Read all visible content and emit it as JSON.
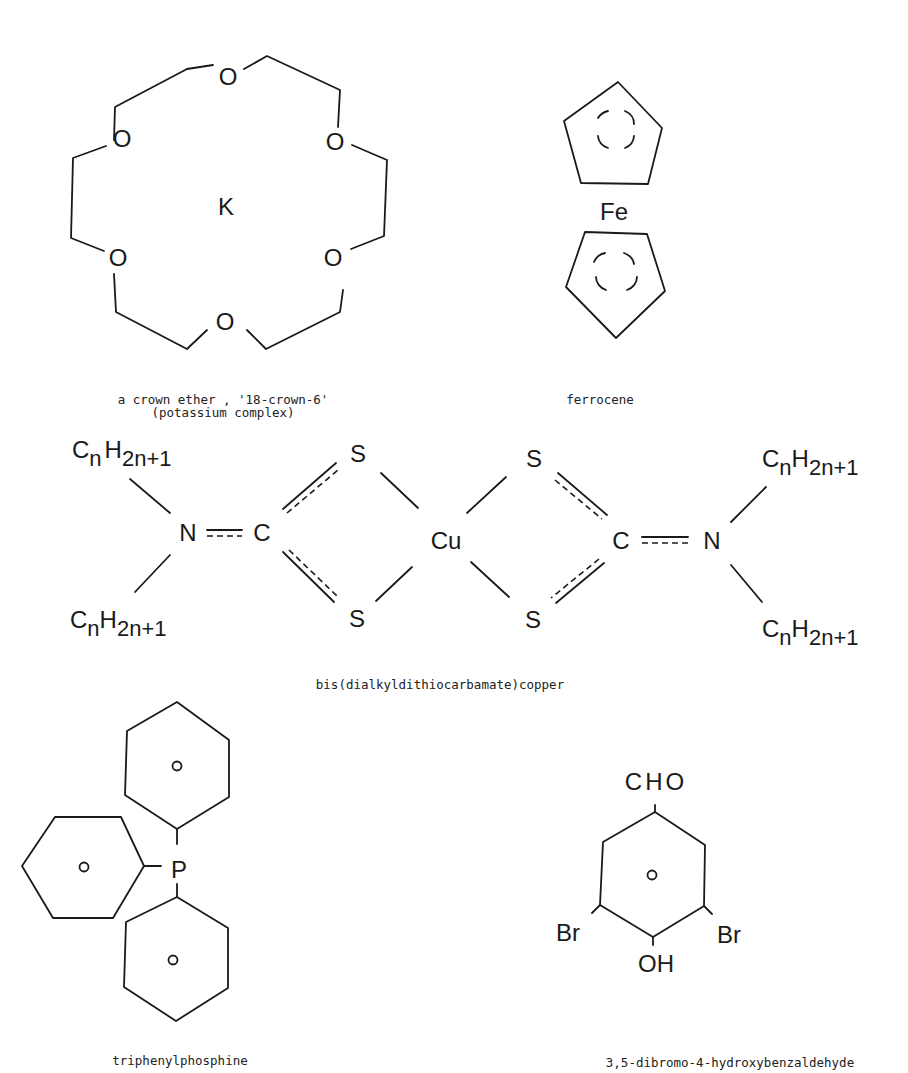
{
  "page": {
    "header_left": "Ionophores",
    "header_right": "419"
  },
  "structures": {
    "crown_ether": {
      "center_atom": "K",
      "ring_atom": "O",
      "caption_line1": "a crown ether , '18-crown-6'",
      "caption_line2": "(potassium complex)"
    },
    "ferrocene": {
      "center_atom": "Fe",
      "caption": "ferrocene"
    },
    "dithiocarbamate": {
      "metal": "Cu",
      "sulfur": "S",
      "carbon": "C",
      "nitrogen": "N",
      "alkyl_c": "C",
      "alkyl_n": "n",
      "alkyl_h": "H",
      "alkyl_h_sub": "2n+1",
      "caption": "bis(dialkyldithiocarbamate)copper"
    },
    "triphenylphosphine": {
      "center_atom": "P",
      "caption": "triphenylphosphine"
    },
    "dibromobenzaldehyde": {
      "top_group": "CHO",
      "left_group": "Br",
      "right_group": "Br",
      "bottom_group": "OH",
      "caption": "3,5-dibromo-4-hydroxybenzaldehyde"
    }
  }
}
